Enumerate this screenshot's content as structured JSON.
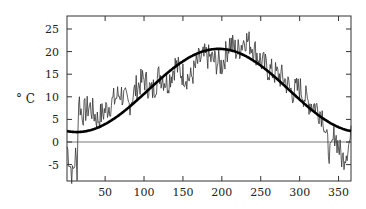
{
  "chart_data": {
    "type": "line",
    "title": "",
    "xlabel": "",
    "ylabel": "° C",
    "xlim": [
      1,
      366
    ],
    "ylim": [
      -8.5,
      28.5
    ],
    "xticks": [
      50,
      100,
      150,
      200,
      250,
      300,
      350
    ],
    "yticks": [
      -5,
      0,
      5,
      10,
      15,
      20,
      25
    ],
    "grid": false,
    "legend": null,
    "reference_line": {
      "y": 0
    },
    "series": [
      {
        "name": "daily temperature",
        "style": "thin",
        "keypoints_x": [
          1,
          5,
          8,
          12,
          14,
          16,
          20,
          30,
          40,
          50,
          60,
          70,
          80,
          90,
          100,
          110,
          120,
          130,
          140,
          150,
          160,
          170,
          180,
          190,
          200,
          210,
          220,
          230,
          240,
          250,
          260,
          270,
          280,
          290,
          300,
          310,
          320,
          330,
          335,
          340,
          345,
          350,
          355,
          360,
          366
        ],
        "keypoints_y": [
          -1,
          -5,
          -7.5,
          -3,
          -6,
          10,
          6,
          8,
          5,
          7,
          9,
          11,
          8,
          12,
          14,
          11,
          15,
          13,
          17,
          15,
          14,
          18,
          19,
          18,
          17,
          22,
          20,
          23,
          21,
          18,
          16,
          15,
          14,
          11,
          12,
          9,
          8,
          6,
          0,
          -3,
          2,
          -1,
          -4,
          -2,
          1
        ]
      },
      {
        "name": "smooth fit",
        "style": "thick",
        "model": "mean + amp*cos(2*pi*(day - peak)/365), clamped flat at start/end",
        "mean": 11.4,
        "amplitude": 9.2,
        "peak_day": 196
      }
    ]
  }
}
